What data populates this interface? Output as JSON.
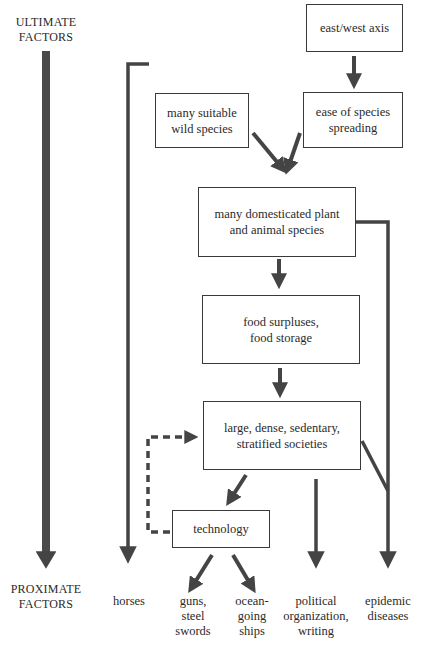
{
  "diagram": {
    "axis": {
      "top_label": "ULTIMATE\nFACTORS",
      "bottom_label": "PROXIMATE\nFACTORS"
    },
    "nodes": {
      "east_west_axis": "east/west axis",
      "wild_species": "many suitable\nwild species",
      "species_spreading": "ease of species\nspreading",
      "domesticated": "many domesticated plant\nand animal species",
      "food_surplus": "food surpluses,\nfood storage",
      "societies": "large, dense, sedentary,\nstratified societies",
      "technology": "technology"
    },
    "outcomes": {
      "horses": "horses",
      "guns": "guns,\nsteel\nswords",
      "ships": "ocean-\ngoing\nships",
      "political": "political\norganization,\nwriting",
      "epidemic": "epidemic\ndiseases"
    },
    "edges": [
      {
        "from": "east_west_axis",
        "to": "species_spreading"
      },
      {
        "from": "wild_species",
        "to": "domesticated"
      },
      {
        "from": "species_spreading",
        "to": "domesticated"
      },
      {
        "from": "wild_species",
        "to": "horses"
      },
      {
        "from": "domesticated",
        "to": "food_surplus"
      },
      {
        "from": "domesticated",
        "to": "epidemic"
      },
      {
        "from": "food_surplus",
        "to": "societies"
      },
      {
        "from": "societies",
        "to": "technology"
      },
      {
        "from": "technology",
        "to": "societies",
        "style": "dashed"
      },
      {
        "from": "societies",
        "to": "political"
      },
      {
        "from": "societies",
        "to": "epidemic"
      },
      {
        "from": "technology",
        "to": "guns"
      },
      {
        "from": "technology",
        "to": "ships"
      }
    ],
    "colors": {
      "line": "#444444",
      "box_border": "#3a3a3a"
    }
  }
}
